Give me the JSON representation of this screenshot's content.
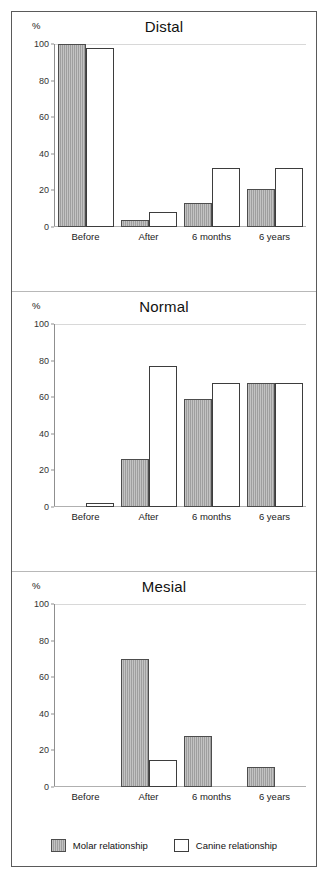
{
  "figure": {
    "axis_unit_label": "%",
    "legend": [
      {
        "key": "molar",
        "label": "Molar relationship",
        "color": "#9e9e9e",
        "style": "filled-gray-hatch"
      },
      {
        "key": "canine",
        "label": "Canine relationship",
        "color": "#ffffff",
        "style": "white-outlined"
      }
    ]
  },
  "chart_data": [
    {
      "type": "bar",
      "title": "Distal",
      "xlabel": "",
      "ylabel": "%",
      "ylim": [
        0,
        100
      ],
      "yticks": [
        0,
        20,
        40,
        60,
        80,
        100
      ],
      "grid": "top-only",
      "legend_position": "bottom",
      "categories": [
        "Before",
        "After",
        "6 months",
        "6 years"
      ],
      "series": [
        {
          "name": "Molar relationship",
          "values": [
            100,
            4,
            13,
            21
          ]
        },
        {
          "name": "Canine relationship",
          "values": [
            98,
            8,
            32,
            32
          ]
        }
      ]
    },
    {
      "type": "bar",
      "title": "Normal",
      "xlabel": "",
      "ylabel": "%",
      "ylim": [
        0,
        100
      ],
      "yticks": [
        0,
        20,
        40,
        60,
        80,
        100
      ],
      "grid": "top-only",
      "legend_position": "bottom",
      "categories": [
        "Before",
        "After",
        "6 months",
        "6 years"
      ],
      "series": [
        {
          "name": "Molar relationship",
          "values": [
            0,
            26,
            59,
            68
          ]
        },
        {
          "name": "Canine relationship",
          "values": [
            2,
            77,
            68,
            68
          ]
        }
      ]
    },
    {
      "type": "bar",
      "title": "Mesial",
      "xlabel": "",
      "ylabel": "%",
      "ylim": [
        0,
        100
      ],
      "yticks": [
        0,
        20,
        40,
        60,
        80,
        100
      ],
      "grid": "top-only",
      "legend_position": "bottom",
      "categories": [
        "Before",
        "After",
        "6 months",
        "6 years"
      ],
      "series": [
        {
          "name": "Molar relationship",
          "values": [
            0,
            70,
            28,
            11
          ]
        },
        {
          "name": "Canine relationship",
          "values": [
            0,
            15,
            0,
            0
          ]
        }
      ]
    }
  ]
}
